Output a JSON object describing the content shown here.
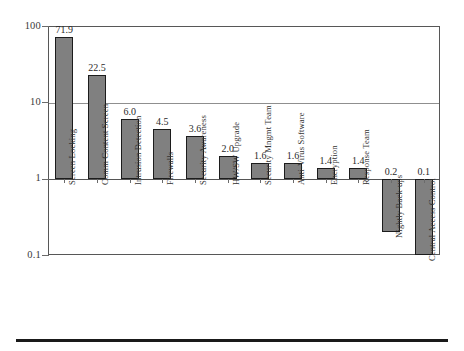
{
  "chart_data": {
    "type": "bar",
    "title": "",
    "subtitle": "",
    "xlabel": "",
    "ylabel": "",
    "scale": "log",
    "ylim": [
      0.1,
      100
    ],
    "grid": true,
    "legend": "none",
    "baseline_value": 1,
    "ytick_labels": [
      "100",
      "10",
      "1",
      "0.1"
    ],
    "ytick_values": [
      100,
      10,
      1,
      0.1
    ],
    "categories": [
      "Screen Locking",
      "Comm Content Screen",
      "Intrusion Detection",
      "Firewalls",
      "Security Awareness",
      "HW/SW Upgrade",
      "Security Mngmt Team",
      "Anti-Virus Software",
      "Encryption",
      "Response Team",
      "Nightly Back-ups",
      "Central Access Control"
    ],
    "values": [
      71.9,
      22.5,
      6.0,
      4.5,
      3.6,
      2.0,
      1.6,
      1.6,
      1.4,
      1.4,
      0.2,
      0.1
    ],
    "value_labels": [
      "71.9",
      "22.5",
      "6.0",
      "4.5",
      "3.6",
      "2.0",
      "1.6",
      "1.6",
      "1.4",
      "1.4",
      "0.2",
      "0.1"
    ],
    "bar_color": "#808080",
    "bar_edge_color": "#1c1c1c",
    "grid_color": "#8f8f8f",
    "frame_color": "#575757",
    "text_color": "#2a2a2a"
  }
}
